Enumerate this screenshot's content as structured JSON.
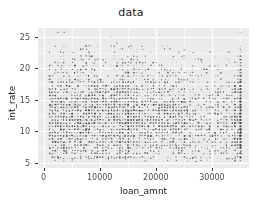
{
  "chart_data": {
    "type": "scatter",
    "title": "data",
    "xlabel": "loan_amnt",
    "ylabel": "int_rate",
    "xlim": [
      -1000,
      36600
    ],
    "ylim": [
      4.2,
      26.4
    ],
    "xticks": [
      0,
      10000,
      20000,
      30000
    ],
    "xtick_labels": [
      "0",
      "10000",
      "20000",
      "30000"
    ],
    "yticks": [
      5,
      10,
      15,
      20,
      25
    ],
    "ytick_labels": [
      "5",
      "10",
      "15",
      "20",
      "25"
    ],
    "grid": true,
    "grid_major_color": "#ffffff",
    "grid_minor_color": "#f5f5f5",
    "panel_background": "#ebebeb",
    "plot_background": "#ffffff",
    "point_color": "#4d4d4d",
    "point_size": 1,
    "point_alpha": 0.35,
    "legend": null,
    "n_points": 9000,
    "notes": [
      "Dense overplotted scatter; discrete lattice from loan_amnt multiples of 500 and quantized int_rate grades",
      "Highest density in lower-left: loan_amnt 1000-15000, int_rate 6-16",
      "Sharp density drop above loan_amnt 25000",
      "Distinct vertical band at loan_amnt 35000 (cap)",
      "Horizontal bands visible at int_rate ~6, 7.5, 8.5, 10, 12, 13, 15, 16, 18, 20, 22",
      "Sparse points above int_rate 24"
    ],
    "density_regions": [
      {
        "x_range": [
          1000,
          15000
        ],
        "y_range": [
          6,
          17
        ],
        "density": "very-high"
      },
      {
        "x_range": [
          15000,
          25000
        ],
        "y_range": [
          6,
          22
        ],
        "density": "medium"
      },
      {
        "x_range": [
          25000,
          34000
        ],
        "y_range": [
          6,
          23
        ],
        "density": "low"
      },
      {
        "x_range": [
          34500,
          35500
        ],
        "y_range": [
          6,
          24
        ],
        "density": "band-high"
      },
      {
        "x_range": [
          1000,
          35000
        ],
        "y_range": [
          24,
          26
        ],
        "density": "very-low"
      }
    ]
  }
}
